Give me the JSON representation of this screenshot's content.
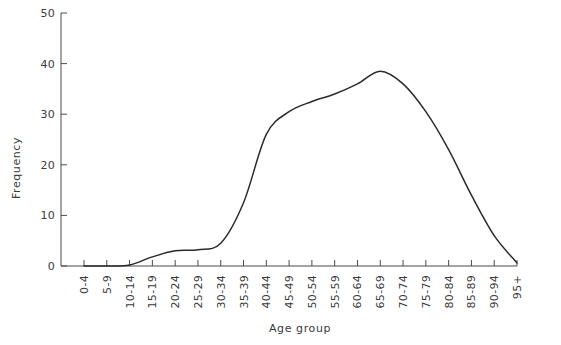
{
  "chart_data": {
    "type": "line",
    "title": "",
    "xlabel": "Age group",
    "ylabel": "Frequency",
    "ylim": [
      0,
      50
    ],
    "yticks": [
      0,
      10,
      20,
      30,
      40,
      50
    ],
    "grid": false,
    "legend": "none",
    "categories": [
      "0-4",
      "5-9",
      "10-14",
      "15-19",
      "20-24",
      "25-29",
      "30-34",
      "35-39",
      "40-44",
      "45-49",
      "50-54",
      "55-59",
      "60-64",
      "65-69",
      "70-74",
      "75-79",
      "80-84",
      "85-89",
      "90-94",
      "95+"
    ],
    "values": [
      0,
      0,
      0.2,
      1.8,
      3.0,
      3.2,
      4.5,
      12.5,
      26.0,
      30.5,
      32.5,
      34.0,
      36.0,
      38.5,
      36.0,
      30.5,
      23.0,
      14.0,
      6.0,
      0.6
    ],
    "series": [
      {
        "name": "Frequency",
        "color": "#2b2b2b",
        "values": [
          0,
          0,
          0.2,
          1.8,
          3.0,
          3.2,
          4.5,
          12.5,
          26.0,
          30.5,
          32.5,
          34.0,
          36.0,
          38.5,
          36.0,
          30.5,
          23.0,
          14.0,
          6.0,
          0.6
        ]
      }
    ]
  },
  "axes": {
    "y_axis_title": "Frequency",
    "x_axis_title": "Age group",
    "y_tick_labels": [
      "0",
      "10",
      "20",
      "30",
      "40",
      "50"
    ],
    "x_tick_labels": [
      "0-4",
      "5-9",
      "10-14",
      "15-19",
      "20-24",
      "25-29",
      "30-34",
      "35-39",
      "40-44",
      "45-49",
      "50-54",
      "55-59",
      "60-64",
      "65-69",
      "70-74",
      "75-79",
      "80-84",
      "85-89",
      "90-94",
      "95+"
    ]
  },
  "colors": {
    "curve": "#2b2b2b",
    "axis": "#4a4a4a",
    "text": "#3a3a3a",
    "background": "#ffffff"
  },
  "caption": ""
}
